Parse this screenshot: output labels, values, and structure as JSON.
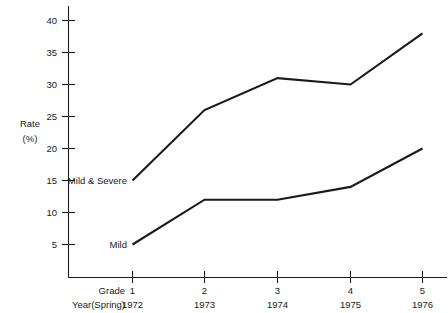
{
  "chart_data": {
    "type": "line",
    "title": "",
    "xlabel": "",
    "ylabel": "Rate (%)",
    "ylabel_line1": "Rate",
    "ylabel_line2": "(%)",
    "grid": false,
    "legend_position": "inline-left-of-line-start",
    "ylim": [
      0,
      42
    ],
    "yticks": [
      5,
      10,
      15,
      20,
      25,
      30,
      35,
      40
    ],
    "ytick_labels": [
      "5",
      "10",
      "15",
      "20",
      "25",
      "30",
      "35",
      "40"
    ],
    "x": [
      1,
      2,
      3,
      4,
      5
    ],
    "categories": [
      "1",
      "2",
      "3",
      "4",
      "5"
    ],
    "xtick_row1_header": "Grade",
    "xtick_row1_labels": [
      "1",
      "2",
      "3",
      "4",
      "5"
    ],
    "xtick_row2_header": "Year(Spring)",
    "xtick_row2_labels": [
      "1972",
      "1973",
      "1974",
      "1975",
      "1976"
    ],
    "series": [
      {
        "name": "Mild & Severe",
        "label": "Mild & Severe",
        "values": [
          15,
          26,
          31,
          30,
          38
        ],
        "color": "#1a1a1a"
      },
      {
        "name": "Mild",
        "label": "Mild",
        "values": [
          5,
          12,
          12,
          14,
          20
        ],
        "color": "#1a1a1a"
      }
    ]
  },
  "axis": {
    "y_title_line1": "Rate",
    "y_title_line2": "(%)"
  },
  "ytick": {
    "t40": "40",
    "t35": "35",
    "t30": "30",
    "t25": "25",
    "t20": "20",
    "t15": "15",
    "t10": "10",
    "t5": "5"
  },
  "xrow_grade": {
    "header": "Grade",
    "v1": "1",
    "v2": "2",
    "v3": "3",
    "v4": "4",
    "v5": "5"
  },
  "xrow_year": {
    "header": "Year(Spring)",
    "v1": "1972",
    "v2": "1973",
    "v3": "1974",
    "v4": "1975",
    "v5": "1976"
  },
  "series_labels": {
    "mild_severe": "Mild & Severe",
    "mild": "Mild"
  }
}
